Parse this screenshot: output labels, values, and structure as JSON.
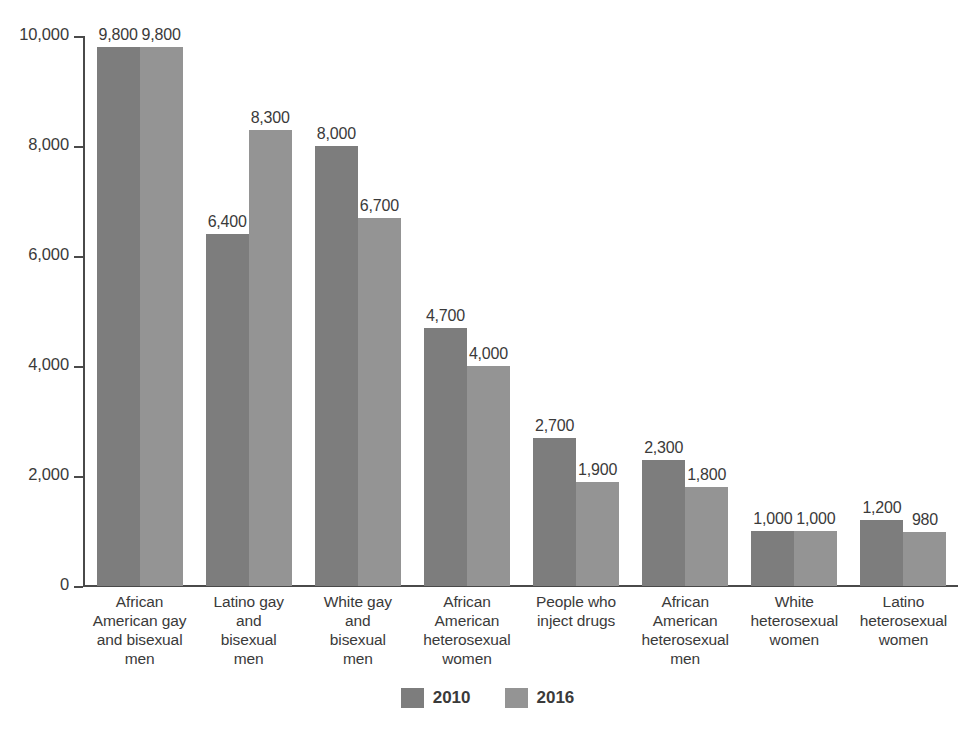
{
  "chart_data": {
    "type": "bar",
    "title": "",
    "xlabel": "",
    "ylabel": "",
    "ylim": [
      0,
      10000
    ],
    "yticks": [
      "0",
      "2,000",
      "4,000",
      "6,000",
      "8,000",
      "10,000"
    ],
    "ytick_values": [
      0,
      2000,
      4000,
      6000,
      8000,
      10000
    ],
    "grid": false,
    "legend_position": "bottom-center",
    "categories": [
      "African American gay and bisexual men",
      "Latino gay and bisexual men",
      "White gay and bisexual men",
      "African American heterosexual women",
      "People who inject drugs",
      "African American heterosexual men",
      "White heterosexual women",
      "Latino heterosexual women"
    ],
    "category_lines": [
      [
        "African",
        "American gay",
        "and bisexual",
        "men"
      ],
      [
        "Latino gay",
        "and",
        "bisexual",
        "men"
      ],
      [
        "White gay",
        "and",
        "bisexual",
        "men"
      ],
      [
        "African",
        "American",
        "heterosexual",
        "women"
      ],
      [
        "People who",
        "inject drugs"
      ],
      [
        "African",
        "American",
        "heterosexual",
        "men"
      ],
      [
        "White",
        "heterosexual",
        "women"
      ],
      [
        "Latino",
        "heterosexual",
        "women"
      ]
    ],
    "series": [
      {
        "name": "2010",
        "color": "#7d7d7d",
        "values": [
          9800,
          6400,
          8000,
          4700,
          2700,
          2300,
          1000,
          1200
        ],
        "labels": [
          "9,800",
          "6,400",
          "8,000",
          "4,700",
          "2,700",
          "2,300",
          "1,000",
          "1,200"
        ]
      },
      {
        "name": "2016",
        "color": "#949494",
        "values": [
          9800,
          8300,
          6700,
          4000,
          1900,
          1800,
          1000,
          980
        ],
        "labels": [
          "9,800",
          "8,300",
          "6,700",
          "4,000",
          "1,900",
          "1,800",
          "1,000",
          "980"
        ]
      }
    ]
  },
  "legend": {
    "items": [
      {
        "label": "2010",
        "color": "#7d7d7d"
      },
      {
        "label": "2016",
        "color": "#949494"
      }
    ]
  },
  "colors": {
    "series_2010": "#7d7d7d",
    "series_2016": "#949494",
    "axis": "#4a4a4a",
    "text": "#3a3a3a",
    "background": "#ffffff"
  }
}
